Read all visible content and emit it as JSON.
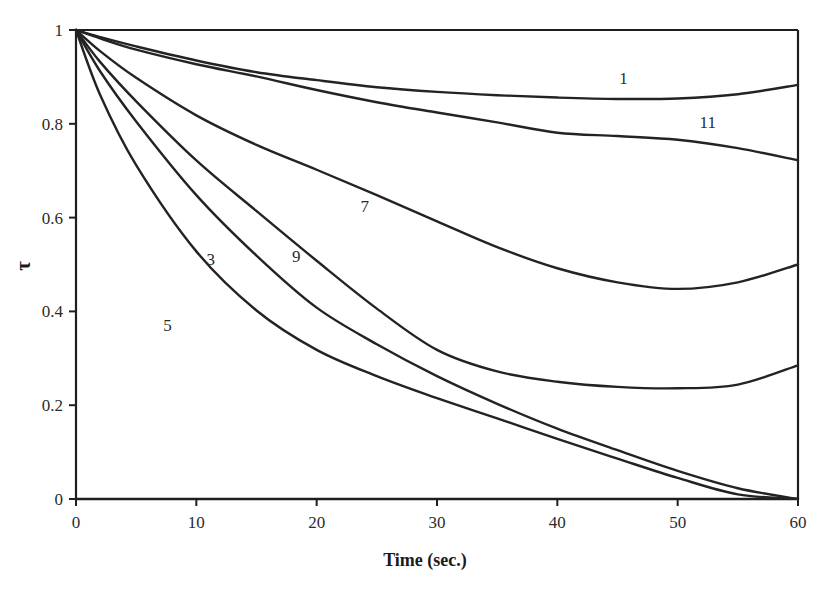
{
  "chart_data": {
    "type": "line",
    "title": "",
    "xlabel": "Time (sec.)",
    "ylabel": "τ",
    "xlim": [
      0,
      60
    ],
    "ylim": [
      0,
      1
    ],
    "grid": false,
    "legend": "inline-curve-labels",
    "x_ticks": [
      0,
      10,
      20,
      30,
      40,
      50,
      60
    ],
    "x_tick_labels": [
      "0",
      "10",
      "20",
      "30",
      "40",
      "50",
      "60"
    ],
    "y_ticks": [
      0,
      0.2,
      0.4,
      0.6,
      0.8,
      1
    ],
    "y_tick_labels": [
      "0",
      "0.2",
      "0.4",
      "0.6",
      "0.8",
      "1"
    ],
    "series": [
      {
        "name": "1",
        "label": "1",
        "label_x": 45.5,
        "label_y": 0.885,
        "x": [
          0,
          2,
          5,
          10,
          15,
          20,
          25,
          30,
          35,
          40,
          45,
          50,
          55,
          60
        ],
        "values": [
          1.0,
          0.985,
          0.965,
          0.935,
          0.91,
          0.893,
          0.878,
          0.868,
          0.861,
          0.856,
          0.853,
          0.854,
          0.863,
          0.883
        ]
      },
      {
        "name": "11",
        "label": "11",
        "label_x": 52.5,
        "label_y": 0.79,
        "x": [
          0,
          2,
          5,
          10,
          15,
          20,
          25,
          30,
          35,
          40,
          45,
          50,
          55,
          60
        ],
        "values": [
          1.0,
          0.982,
          0.958,
          0.927,
          0.901,
          0.872,
          0.846,
          0.824,
          0.803,
          0.781,
          0.774,
          0.766,
          0.748,
          0.722
        ]
      },
      {
        "name": "7",
        "label": "7",
        "label_x": 24.0,
        "label_y": 0.612,
        "x": [
          0,
          2,
          5,
          10,
          15,
          20,
          25,
          30,
          35,
          40,
          45,
          50,
          55,
          60
        ],
        "values": [
          1.0,
          0.955,
          0.898,
          0.818,
          0.755,
          0.702,
          0.648,
          0.592,
          0.537,
          0.492,
          0.462,
          0.448,
          0.462,
          0.5
        ]
      },
      {
        "name": "9",
        "label": "9",
        "label_x": 18.3,
        "label_y": 0.505,
        "x": [
          0,
          2,
          5,
          10,
          15,
          20,
          25,
          30,
          35,
          40,
          45,
          50,
          55,
          60
        ],
        "values": [
          1.0,
          0.932,
          0.848,
          0.722,
          0.614,
          0.508,
          0.406,
          0.318,
          0.272,
          0.25,
          0.239,
          0.236,
          0.244,
          0.285
        ]
      },
      {
        "name": "3",
        "label": "3",
        "label_x": 11.2,
        "label_y": 0.498,
        "x": [
          0,
          2,
          5,
          10,
          15,
          20,
          25,
          30,
          35,
          40,
          45,
          50,
          55,
          60
        ],
        "values": [
          1.0,
          0.912,
          0.805,
          0.648,
          0.519,
          0.408,
          0.33,
          0.262,
          0.203,
          0.15,
          0.104,
          0.06,
          0.023,
          0.0
        ]
      },
      {
        "name": "5",
        "label": "5",
        "label_x": 7.6,
        "label_y": 0.358,
        "x": [
          0,
          2,
          5,
          10,
          15,
          20,
          25,
          30,
          35,
          40,
          45,
          50,
          55,
          60
        ],
        "values": [
          1.0,
          0.862,
          0.712,
          0.528,
          0.402,
          0.318,
          0.262,
          0.215,
          0.172,
          0.128,
          0.086,
          0.045,
          0.01,
          0.0
        ]
      }
    ]
  },
  "colors": {
    "curve": "#232323",
    "frame": "#1f1f1f",
    "text": "#1a1a1a",
    "tick_text": "#2b2b2b",
    "background": "#ffffff"
  }
}
